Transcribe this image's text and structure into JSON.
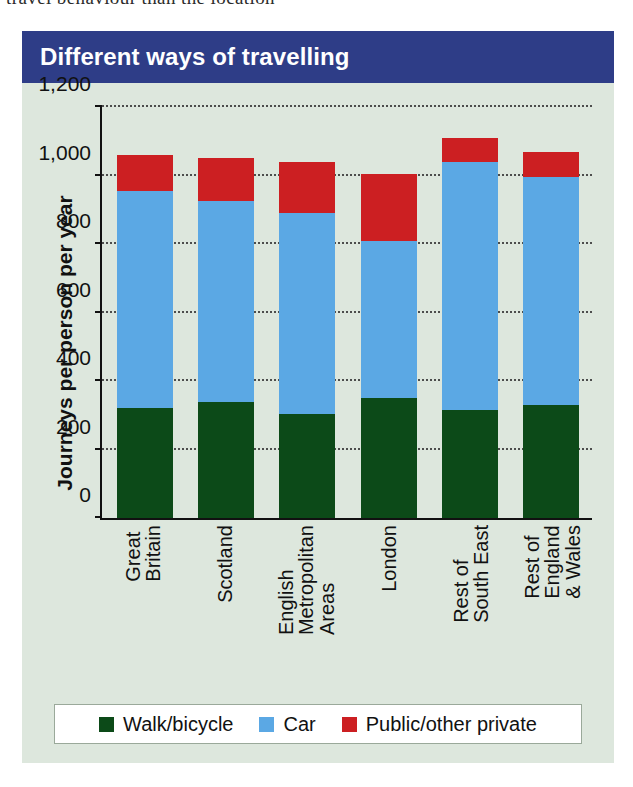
{
  "page": {
    "cropped_text_above_figure": "travel behaviour than the location"
  },
  "figure": {
    "title": "Different ways of travelling",
    "title_bar_color": "#2e3d87",
    "background_color": "#dde7dd"
  },
  "chart_data": {
    "type": "bar",
    "stacked": true,
    "title": "Different ways of travelling",
    "xlabel": "",
    "ylabel": "Journeys per person per year",
    "ylim": [
      0,
      1200
    ],
    "yticks": [
      0,
      200,
      400,
      600,
      800,
      1000,
      1200
    ],
    "ytick_labels": [
      "0",
      "200",
      "400",
      "600",
      "800",
      "1,000",
      "1,200"
    ],
    "grid": true,
    "legend_position": "bottom",
    "categories": [
      "Great Britain",
      "Scotland",
      "English Metropolitan Areas",
      "London",
      "Rest of South East",
      "Rest of England & Wales"
    ],
    "category_label_lines": [
      [
        "Great",
        "Britain"
      ],
      [
        "Scotland"
      ],
      [
        "English",
        "Metropolitan",
        "Areas"
      ],
      [
        "London"
      ],
      [
        "Rest of",
        "South East"
      ],
      [
        "Rest of",
        "England",
        "& Wales"
      ]
    ],
    "series": [
      {
        "name": "Walk/bicycle",
        "color": "#0c4a18",
        "values": [
          320,
          340,
          305,
          350,
          315,
          330
        ]
      },
      {
        "name": "Car",
        "color": "#5ba8e4",
        "values": [
          635,
          585,
          585,
          460,
          725,
          665
        ]
      },
      {
        "name": "Public/other private",
        "color": "#cc1f22",
        "values": [
          105,
          125,
          150,
          195,
          70,
          75
        ]
      }
    ],
    "totals": [
      1060,
      1050,
      1040,
      1005,
      1110,
      1070
    ]
  },
  "legend": {
    "items": [
      {
        "label": "Walk/bicycle",
        "color": "#0c4a18"
      },
      {
        "label": "Car",
        "color": "#5ba8e4"
      },
      {
        "label": "Public/other private",
        "color": "#cc1f22"
      }
    ]
  }
}
